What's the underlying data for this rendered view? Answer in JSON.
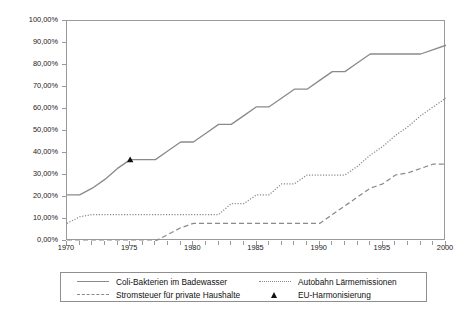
{
  "chart_data": {
    "type": "line",
    "title": "",
    "subtitle": "",
    "xlabel": "",
    "ylabel": "",
    "xlim": [
      1970,
      2000
    ],
    "ylim": [
      0,
      100
    ],
    "grid": false,
    "legend_position": "bottom",
    "y_ticks": [
      0,
      10,
      20,
      30,
      40,
      50,
      60,
      70,
      80,
      90,
      100
    ],
    "y_tick_labels": [
      "0,00%",
      "10,00%",
      "20,00%",
      "30,00%",
      "40,00%",
      "50,00%",
      "60,00%",
      "70,00%",
      "80,00%",
      "90,00%",
      "100,00%"
    ],
    "x_ticks": [
      1970,
      1971,
      1972,
      1973,
      1974,
      1975,
      1976,
      1977,
      1978,
      1979,
      1980,
      1981,
      1982,
      1983,
      1984,
      1985,
      1986,
      1987,
      1988,
      1989,
      1990,
      1991,
      1992,
      1993,
      1994,
      1995,
      1996,
      1997,
      1998,
      1999,
      2000
    ],
    "x_major_ticks": [
      1970,
      1975,
      1980,
      1985,
      1990,
      1995,
      2000
    ],
    "x_tick_labels": [
      "1970",
      "1975",
      "1980",
      "1985",
      "1990",
      "1995",
      "2000"
    ],
    "x": [
      1970,
      1971,
      1972,
      1973,
      1974,
      1975,
      1976,
      1977,
      1978,
      1979,
      1980,
      1981,
      1982,
      1983,
      1984,
      1985,
      1986,
      1987,
      1988,
      1989,
      1990,
      1991,
      1992,
      1993,
      1994,
      1995,
      1996,
      1997,
      1998,
      1999,
      2000
    ],
    "series": [
      {
        "name": "Coli-Bakterien im Badewasser",
        "style": "solid",
        "color": "#8a8a8a",
        "values": [
          21,
          21,
          24,
          28,
          33,
          37,
          37,
          37,
          41,
          45,
          45,
          49,
          53,
          53,
          57,
          61,
          61,
          65,
          69,
          69,
          73,
          77,
          77,
          81,
          85,
          85,
          85,
          85,
          85,
          87,
          89
        ]
      },
      {
        "name": "Autobahn Lärmemissionen",
        "style": "dotted",
        "color": "#8a8a8a",
        "values": [
          8,
          11,
          12,
          12,
          12,
          12,
          12,
          12,
          12,
          12,
          12,
          12,
          12,
          17,
          17,
          21,
          21,
          26,
          26,
          30,
          30,
          30,
          30,
          34,
          39,
          43,
          48,
          52,
          57,
          61,
          65
        ]
      },
      {
        "name": "Stromsteuer für private Haushalte",
        "style": "dashed",
        "color": "#8a8a8a",
        "values": [
          0,
          0,
          0,
          0,
          0,
          0,
          0,
          0,
          3,
          6,
          8,
          8,
          8,
          8,
          8,
          8,
          8,
          8,
          8,
          8,
          8,
          12,
          16,
          20,
          24,
          26,
          30,
          31,
          33,
          35,
          35
        ]
      }
    ],
    "markers": [
      {
        "name": "EU-Harmonisierung",
        "shape": "triangle",
        "color": "#111111",
        "points": [
          {
            "x": 1975,
            "y": 37
          }
        ]
      }
    ],
    "legend": [
      {
        "label": "Coli-Bakterien im Badewasser",
        "style": "solid",
        "column": "left"
      },
      {
        "label": "Stromsteuer für private Haushalte",
        "style": "dashed",
        "column": "left"
      },
      {
        "label": "Autobahn Lärmemissionen",
        "style": "dotted",
        "column": "right"
      },
      {
        "label": "EU-Harmonisierung",
        "style": "triangle",
        "column": "right"
      }
    ]
  }
}
